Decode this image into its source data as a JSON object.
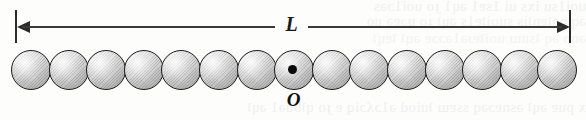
{
  "figure": {
    "caption_type": "physics-diagram"
  },
  "dimension": {
    "label": "L",
    "name": "length-of-rod",
    "span_start_px": 15,
    "span_end_px": 570,
    "arrow_style": "double-headed",
    "line_color": "#3a3a3a",
    "tick_color": "#2b2b2b"
  },
  "pivot": {
    "label": "O",
    "name": "pivot-point-origin",
    "marker": "filled-dot",
    "marker_color": "#0a0a0a",
    "center_x_px": 293,
    "center_y_px": 70,
    "on_sphere_index": 7
  },
  "spheres": {
    "count": 15,
    "diameter_px": 40,
    "spacing_px": 37.6,
    "first_left_px": 11,
    "top_px": 50,
    "fill_color": "#c9c9c9",
    "outline_color": "#1d1d1d",
    "shading": "radial-highlight-with-diagonal-hatch",
    "items": [
      {
        "index": 0,
        "left_px": 11.0,
        "has_pivot": false
      },
      {
        "index": 1,
        "left_px": 48.6,
        "has_pivot": false
      },
      {
        "index": 2,
        "left_px": 86.2,
        "has_pivot": false
      },
      {
        "index": 3,
        "left_px": 123.8,
        "has_pivot": false
      },
      {
        "index": 4,
        "left_px": 161.4,
        "has_pivot": false
      },
      {
        "index": 5,
        "left_px": 199.0,
        "has_pivot": false
      },
      {
        "index": 6,
        "left_px": 236.6,
        "has_pivot": false
      },
      {
        "index": 7,
        "left_px": 274.2,
        "has_pivot": true
      },
      {
        "index": 8,
        "left_px": 311.8,
        "has_pivot": false
      },
      {
        "index": 9,
        "left_px": 349.4,
        "has_pivot": false
      },
      {
        "index": 10,
        "left_px": 387.0,
        "has_pivot": false
      },
      {
        "index": 11,
        "left_px": 424.6,
        "has_pivot": false
      },
      {
        "index": 12,
        "left_px": 462.2,
        "has_pivot": false
      },
      {
        "index": 13,
        "left_px": 499.8,
        "has_pivot": false
      },
      {
        "index": 14,
        "left_px": 537.4,
        "has_pivot": false
      }
    ]
  },
  "background": {
    "page_color": "#fdfdfc",
    "bleed_through": [
      "uoi1su  ixs  ui  1sɐ1  ǝɥ1  ɟo  uoi1ɔǝs",
      "ǝq  pǝʇɐnʇis  suoiʇɐ1s  ǝɥʇ  ɟo  ɥɔɐǝ  uo",
      "ǝnp  ǝq  ʇsnɯ  uoiʇɐɹǝ1ǝɔɔɐ  ǝɥʇ  ʇɐɥʇ",
      "x  puɐ  ǝɥʇ  ǝsnɐɔǝq  ssɐɯ  ʇuiod  ǝ1ɔʎɔiq  ɐ  ɟo  ɥʇƃuǝ1  ǝɥʇ"
    ]
  }
}
